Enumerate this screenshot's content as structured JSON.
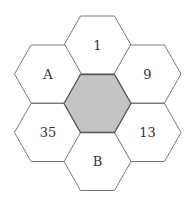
{
  "diagram": {
    "type": "hexagon-honeycomb",
    "colors": {
      "background": "#ffffff",
      "hex_fill": "#ffffff",
      "hex_stroke": "#7a7a7a",
      "center_fill": "#c4c4c4",
      "center_stroke": "#555555",
      "text": "#333333"
    },
    "hexes": [
      {
        "id": "center",
        "label": "",
        "shaded": true
      },
      {
        "id": "top",
        "label": "1"
      },
      {
        "id": "upper-right",
        "label": "9"
      },
      {
        "id": "lower-right",
        "label": "13"
      },
      {
        "id": "bottom",
        "label": "B"
      },
      {
        "id": "lower-left",
        "label": "35"
      },
      {
        "id": "upper-left",
        "label": "A"
      }
    ]
  }
}
